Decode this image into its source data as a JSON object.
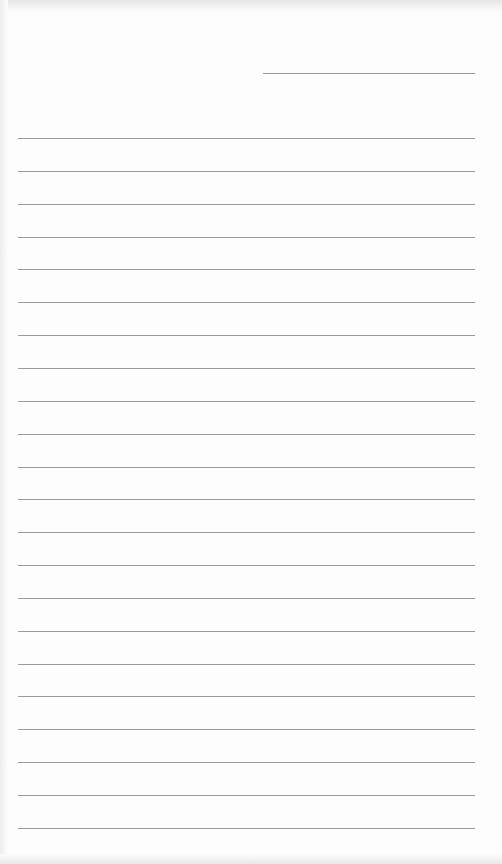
{
  "paper": {
    "type": "lined-paper",
    "background": "#fdfdfd",
    "line_color": "#9a9a9a",
    "header_line": {
      "x1": 263,
      "x2": 475,
      "y": 73
    },
    "rules": {
      "x1": 18,
      "x2": 475,
      "first_y": 138,
      "spacing": 32.85,
      "count": 22
    }
  }
}
